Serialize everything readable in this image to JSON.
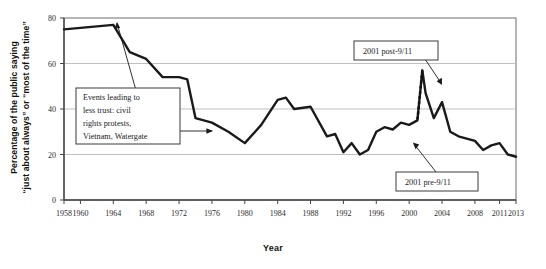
{
  "chart_data": {
    "type": "line",
    "title": "",
    "xlabel": "Year",
    "ylabel_line1": "Percentage of the public saying",
    "ylabel_line2": "“just about always” or “most of the time”",
    "xlim": [
      1958,
      2013
    ],
    "ylim": [
      0,
      80
    ],
    "grid": true,
    "legend": "none",
    "ytick_labels": [
      "0",
      "20",
      "40",
      "60",
      "80"
    ],
    "ytick_values": [
      0,
      20,
      40,
      60,
      80
    ],
    "xtick_labels": [
      "1958",
      "1960",
      "1964",
      "1968",
      "1972",
      "1976",
      "1980",
      "1984",
      "1988",
      "1992",
      "1996",
      "2000",
      "2004",
      "2008",
      "2011",
      "2013"
    ],
    "xtick_values": [
      1958,
      1960,
      1964,
      1968,
      1972,
      1976,
      1980,
      1984,
      1988,
      1992,
      1996,
      2000,
      2004,
      2008,
      2011,
      2013
    ],
    "series": [
      {
        "name": "Trust in government",
        "x": [
          1958,
          1964,
          1966,
          1968,
          1970,
          1972,
          1973,
          1974,
          1976,
          1978,
          1980,
          1982,
          1984,
          1985,
          1986,
          1988,
          1990,
          1991,
          1992,
          1993,
          1994,
          1995,
          1996,
          1997,
          1998,
          1999,
          2000,
          2001,
          2001.6,
          2002,
          2003,
          2004,
          2005,
          2006,
          2007,
          2008,
          2009,
          2010,
          2011,
          2012,
          2013
        ],
        "y": [
          75,
          77,
          65,
          62,
          54,
          54,
          53,
          36,
          34,
          30,
          25,
          33,
          44,
          45,
          40,
          41,
          28,
          29,
          21,
          25,
          20,
          22,
          30,
          32,
          31,
          34,
          33,
          35,
          57,
          47,
          36,
          43,
          30,
          28,
          27,
          26,
          22,
          24,
          25,
          20,
          19
        ]
      }
    ],
    "annotations": [
      {
        "id": "events-leading-to-less-trust",
        "text_lines": [
          "Events leading to",
          "less trust: civil",
          "rights protests,",
          "Vietnam, Watergate"
        ],
        "points_to": [
          1964,
          77
        ]
      },
      {
        "id": "2001-post-911",
        "text_lines": [
          "2001 post-9/11"
        ],
        "points_to": [
          2001.6,
          57
        ]
      },
      {
        "id": "2001-pre-911",
        "text_lines": [
          "2001 pre-9/11"
        ],
        "points_to": [
          2001,
          35
        ]
      }
    ]
  },
  "axes": {
    "y_title_line1": "Percentage of the public saying",
    "y_title_line2": "“just about always” or “most of the time”",
    "x_title": "Year"
  },
  "colors": {
    "line": "#1a1a1a",
    "grid": "#b8b8b8",
    "axis": "#555555",
    "text": "#1a1a1a",
    "box_border": "#3a3a3a",
    "background": "#ffffff"
  }
}
